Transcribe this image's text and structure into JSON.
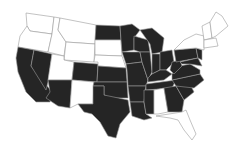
{
  "map": {
    "title": "United States choropleth (binary)",
    "colors": {
      "shaded": "#252525",
      "unshaded": "#ffffff",
      "border": "#9a9a9a"
    },
    "shaded_states": [
      "CA",
      "NV",
      "AZ",
      "CO",
      "ND",
      "KS",
      "OK",
      "TX",
      "MN",
      "IA",
      "MO",
      "AR",
      "LA",
      "WI",
      "IL",
      "MI",
      "IN",
      "OH",
      "KY",
      "TN",
      "MS",
      "GA",
      "SC",
      "NC",
      "VA",
      "WV",
      "PA",
      "MD",
      "DE",
      "NJ"
    ],
    "unshaded_states": [
      "WA",
      "OR",
      "ID",
      "MT",
      "WY",
      "UT",
      "NM",
      "SD",
      "NE",
      "AL",
      "FL",
      "NY",
      "VT",
      "NH",
      "ME",
      "MA",
      "CT",
      "RI"
    ]
  }
}
